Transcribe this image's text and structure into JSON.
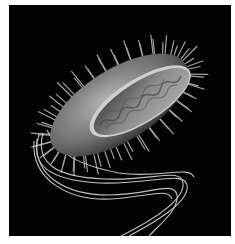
{
  "image": {
    "subject": "bacterium illustration",
    "description": "Rod-shaped bacterium with pili and long flagella, cutaway showing interior, on black background",
    "colors": {
      "background": "#030303",
      "border": "#ffffff",
      "cell_body": "#8a8a8a",
      "highlight": "#e0e0e0"
    }
  }
}
